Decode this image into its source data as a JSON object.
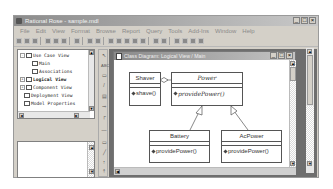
{
  "app": {
    "title": "Rational Rose - sample.mdl",
    "window_buttons": [
      "_",
      "□",
      "×"
    ]
  },
  "menu": [
    "File",
    "Edit",
    "View",
    "Format",
    "Browse",
    "Report",
    "Query",
    "Tools",
    "Add-Ins",
    "Window",
    "Help"
  ],
  "toolbar": {
    "icons": [
      "new-icon",
      "open-icon",
      "save-icon",
      "cut-icon",
      "copy-icon",
      "paste-icon",
      "print-icon",
      "help-icon",
      "browse-icon",
      "class-diagram-icon",
      "usecase-diagram-icon",
      "component-diagram-icon",
      "deployment-diagram-icon",
      "sequence-diagram-icon",
      "statechart-icon",
      "back-icon",
      "zoom-out-icon",
      "zoom-in-icon",
      "fit-icon",
      "undo-fit-icon"
    ]
  },
  "browser_tree": {
    "items": [
      {
        "label": "Use Case View",
        "level": 0,
        "expanded": true,
        "icon": "folder-icon"
      },
      {
        "label": "Main",
        "level": 1,
        "icon": "diagram-icon"
      },
      {
        "label": "Associations",
        "level": 1,
        "icon": "association-icon"
      },
      {
        "label": "Logical View",
        "level": 0,
        "expanded": false,
        "icon": "folder-icon",
        "bold": true
      },
      {
        "label": "Component View",
        "level": 0,
        "expanded": false,
        "icon": "folder-icon"
      },
      {
        "label": "Deployment View",
        "level": 0,
        "icon": "deployment-icon"
      },
      {
        "label": "Model Properties",
        "level": 0,
        "icon": "properties-icon"
      }
    ]
  },
  "tool_palette": [
    "select-tool",
    "text-tool",
    "note-tool",
    "anchor-tool",
    "class-tool",
    "interface-tool",
    "association-tool",
    "aggregation-tool",
    "dependency-tool",
    "package-tool",
    "generalization-tool",
    "realize-tool"
  ],
  "diagram_window": {
    "title": "Class Diagram: Logical View / Main",
    "classes": [
      {
        "name": "Shaver",
        "operation": "shave()",
        "abstract": false
      },
      {
        "name": "Power",
        "operation": "providePower()",
        "abstract": true
      },
      {
        "name": "Battery",
        "operation": "providePower()",
        "abstract": false
      },
      {
        "name": "AcPower",
        "operation": "providePower()",
        "abstract": false
      }
    ],
    "relations": [
      {
        "type": "aggregation",
        "from": "Shaver",
        "to": "Power"
      },
      {
        "type": "generalization",
        "from": "Battery",
        "to": "Power"
      },
      {
        "type": "generalization",
        "from": "AcPower",
        "to": "Power"
      }
    ]
  }
}
